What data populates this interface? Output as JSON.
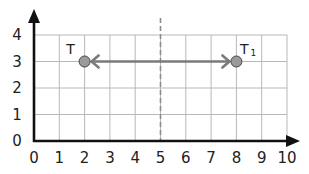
{
  "diagram": {
    "type": "coordinate-grid-translation",
    "x_axis": {
      "min": 0,
      "max": 10,
      "ticks": [
        "0",
        "1",
        "2",
        "3",
        "4",
        "5",
        "6",
        "7",
        "8",
        "9",
        "10"
      ]
    },
    "y_axis": {
      "min": 0,
      "max": 4,
      "ticks": [
        "0",
        "1",
        "2",
        "3",
        "4"
      ]
    },
    "mirror_line": {
      "x": 5,
      "style": "dashed"
    },
    "points": [
      {
        "label": "T",
        "subscript": "",
        "x": 2,
        "y": 3
      },
      {
        "label": "T",
        "subscript": "1",
        "x": 8,
        "y": 3
      }
    ],
    "arrow": {
      "from_x": 2,
      "to_x": 8,
      "y": 3,
      "double_headed": true
    },
    "colors": {
      "grid": "#b8b8b8",
      "axis": "#111111",
      "arrow": "#7a7a7a",
      "point_fill": "#9a9a9a",
      "mirror": "#8a8a8a"
    }
  }
}
